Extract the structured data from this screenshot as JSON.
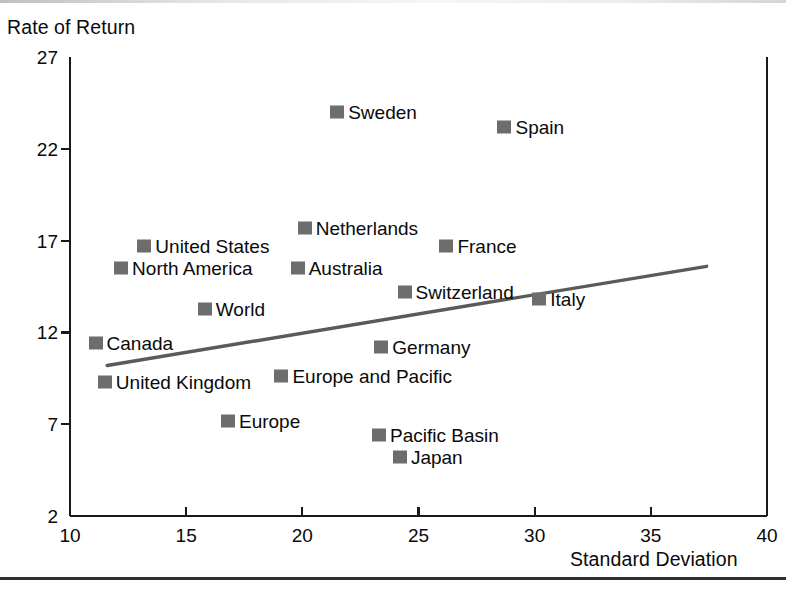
{
  "figure": {
    "y_axis_title": "Rate of Return",
    "x_axis_title": "Standard Deviation"
  },
  "chart_data": {
    "type": "scatter",
    "title": "",
    "xlabel": "Standard Deviation",
    "ylabel": "Rate of Return",
    "xlim": [
      10,
      40
    ],
    "ylim": [
      2,
      27
    ],
    "xticks": [
      10,
      15,
      20,
      25,
      30,
      35,
      40
    ],
    "yticks": [
      2,
      7,
      12,
      17,
      22,
      27
    ],
    "grid": false,
    "legend": "none",
    "marker_color": "#6d6d6d",
    "axis_color": "#1a1a1a",
    "trendline": {
      "label": "",
      "color": "#5a5a5a",
      "x_start": 11.6,
      "y_start": 10.2,
      "x_end": 37.4,
      "y_end": 15.6
    },
    "points": [
      {
        "label": "Sweden",
        "x": 21.5,
        "y": 24.0,
        "label_side": "right"
      },
      {
        "label": "Spain",
        "x": 28.7,
        "y": 23.2,
        "label_side": "right"
      },
      {
        "label": "Netherlands",
        "x": 20.1,
        "y": 17.7,
        "label_side": "right"
      },
      {
        "label": "United States",
        "x": 13.2,
        "y": 16.7,
        "label_side": "right"
      },
      {
        "label": "France",
        "x": 26.2,
        "y": 16.7,
        "label_side": "right"
      },
      {
        "label": "North America",
        "x": 12.2,
        "y": 15.5,
        "label_side": "right"
      },
      {
        "label": "Australia",
        "x": 19.8,
        "y": 15.5,
        "label_side": "right"
      },
      {
        "label": "Switzerland",
        "x": 24.4,
        "y": 14.2,
        "label_side": "right"
      },
      {
        "label": "Italy",
        "x": 30.2,
        "y": 13.8,
        "label_side": "right"
      },
      {
        "label": "World",
        "x": 15.8,
        "y": 13.3,
        "label_side": "right"
      },
      {
        "label": "Canada",
        "x": 11.1,
        "y": 11.4,
        "label_side": "right"
      },
      {
        "label": "Germany",
        "x": 23.4,
        "y": 11.2,
        "label_side": "right"
      },
      {
        "label": "Europe and Pacific",
        "x": 19.1,
        "y": 9.6,
        "label_side": "right"
      },
      {
        "label": "United Kingdom",
        "x": 11.5,
        "y": 9.3,
        "label_side": "right"
      },
      {
        "label": "Europe",
        "x": 16.8,
        "y": 7.2,
        "label_side": "right"
      },
      {
        "label": "Pacific Basin",
        "x": 23.3,
        "y": 6.4,
        "label_side": "right"
      },
      {
        "label": "Japan",
        "x": 24.2,
        "y": 5.2,
        "label_side": "right"
      }
    ]
  }
}
